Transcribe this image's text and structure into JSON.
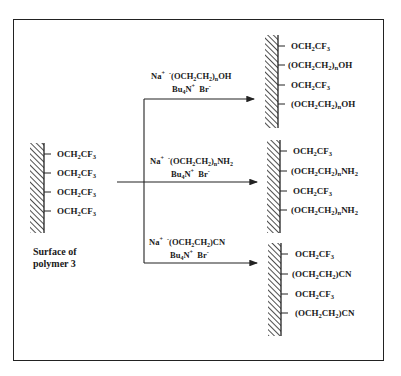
{
  "figure": {
    "starting_surface": {
      "caption_line1": "Surface of",
      "caption_line2": "polymer 3",
      "groups": [
        "OCH2CF3",
        "OCH2CF3",
        "OCH2CF3",
        "OCH2CF3"
      ]
    },
    "reactions": [
      {
        "reagent_line1": {
          "cation": "Na",
          "cation_charge": "+",
          "anion_charge": "-",
          "anion": "(OCH2CH2)nOH"
        },
        "reagent_line2": {
          "salt": "Bu4N",
          "salt_charge": "+",
          "counter": "Br",
          "counter_charge": "-"
        },
        "product_groups": [
          "OCH2CF3",
          "(OCH2CH2)nOH",
          "OCH2CF3",
          "(OCH2CH2)nOH"
        ]
      },
      {
        "reagent_line1": {
          "cation": "Na",
          "cation_charge": "+",
          "anion_charge": "-",
          "anion": "(OCH2CH2)nNH2"
        },
        "reagent_line2": {
          "salt": "Bu4N",
          "salt_charge": "+",
          "counter": "Br",
          "counter_charge": "-"
        },
        "product_groups": [
          "OCH2CF3",
          "(OCH2CH2)nNH2",
          "OCH2CF3",
          "(OCH2CH2)nNH2"
        ]
      },
      {
        "reagent_line1": {
          "cation": "Na",
          "cation_charge": "+",
          "anion_charge": "-",
          "anion": "(OCH2CH2)CN"
        },
        "reagent_line2": {
          "salt": "Bu4N",
          "salt_charge": "+",
          "counter": "Br",
          "counter_charge": "-"
        },
        "product_groups": [
          "OCH2CF3",
          "(OCH2CH2)CN",
          "OCH2CF3",
          "(OCH2CH2)CN"
        ]
      }
    ],
    "colors": {
      "ink": "#1a1a1a",
      "background": "#ffffff",
      "frame": "#222222"
    }
  }
}
